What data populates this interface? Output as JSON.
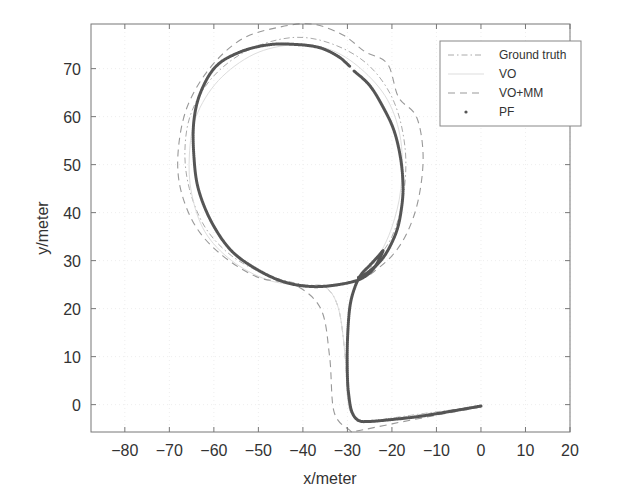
{
  "chart_data": {
    "type": "line",
    "title": "",
    "xlabel": "x/meter",
    "ylabel": "y/meter",
    "xlim": [
      -87.6,
      20
    ],
    "ylim": [
      -5.7,
      79.3
    ],
    "xticks": [
      -80,
      -70,
      -60,
      -50,
      -40,
      -30,
      -20,
      -10,
      0,
      10,
      20
    ],
    "yticks": [
      0,
      10,
      20,
      30,
      40,
      50,
      60,
      70
    ],
    "grid": true,
    "legend_position": "upper right",
    "series": [
      {
        "name": "Ground truth",
        "style": "dash-dot",
        "color": "#aaaaaa",
        "x": [
          0,
          -10,
          -20,
          -26,
          -29,
          -30,
          -30.5,
          -32,
          -35,
          -40,
          -48,
          -56,
          -62,
          -65.5,
          -66.5,
          -65,
          -60,
          -52,
          -42,
          -33,
          -25,
          -19.5,
          -17,
          -17.5,
          -20,
          -24,
          -26
        ],
        "y": [
          -0.4,
          -1.5,
          -2.8,
          -3.7,
          -2,
          2,
          10,
          20,
          24.5,
          25,
          27,
          31,
          37,
          45,
          53,
          61,
          68.5,
          74,
          76.5,
          75,
          70.5,
          63,
          53,
          43,
          35,
          29.5,
          27
        ]
      },
      {
        "name": "VO",
        "style": "solid-light",
        "color": "#dddddd",
        "x": [
          0,
          -10,
          -20,
          -26,
          -29,
          -30,
          -30.5,
          -32,
          -35,
          -40,
          -48,
          -56,
          -62,
          -65,
          -65.5,
          -64,
          -59,
          -51,
          -42,
          -34,
          -27,
          -21,
          -18,
          -18,
          -20,
          -23,
          -26
        ],
        "y": [
          -0.4,
          -1.6,
          -2.9,
          -3.6,
          -2,
          2,
          10,
          20,
          24.5,
          24.8,
          26,
          30,
          36,
          44,
          52,
          60,
          67.5,
          73,
          75,
          74,
          70,
          63.5,
          55,
          45,
          37,
          31,
          28
        ]
      },
      {
        "name": "VO+MM",
        "style": "dashed",
        "color": "#999999",
        "x": [
          0,
          -10,
          -20,
          -28,
          -29.5,
          -33,
          -34,
          -36,
          -42,
          -50,
          -58,
          -64,
          -67.5,
          -68,
          -66,
          -61,
          -54,
          -46,
          -38,
          -31,
          -26,
          -21,
          -18.5,
          -14.5,
          -13,
          -14,
          -16.5,
          -20,
          -25
        ],
        "y": [
          -0.5,
          -2.2,
          -4,
          -5.5,
          -5.3,
          -1.5,
          10,
          20,
          25,
          26.5,
          31,
          37,
          45,
          53,
          62,
          70,
          76,
          78.5,
          79.3,
          77,
          73.5,
          71,
          64,
          60,
          52,
          43,
          36,
          31,
          27
        ]
      },
      {
        "name": "PF",
        "style": "dots",
        "color": "#555555",
        "x": [
          0,
          -5,
          -10,
          -15,
          -20,
          -25,
          -27.5,
          -29,
          -29.7,
          -30,
          -30,
          -29.5,
          -28.5,
          -27,
          -25,
          -23,
          -22,
          -24,
          -27,
          -32,
          -38,
          -44,
          -50,
          -56,
          -60.5,
          -63.5,
          -64.5,
          -64.5,
          -63,
          -59.5,
          -54,
          -47.5,
          -41,
          -36,
          -32,
          -29.5
        ],
        "y": [
          -0.3,
          -1.1,
          -1.9,
          -2.6,
          -3.1,
          -3.5,
          -3.3,
          -1.5,
          2,
          6,
          13,
          20,
          24,
          27,
          29,
          31,
          32,
          28.5,
          26.2,
          25,
          24.6,
          25.5,
          28,
          32,
          38,
          45,
          52,
          59,
          65,
          70.5,
          73.5,
          75,
          75,
          74.3,
          72.5,
          70.5
        ]
      },
      {
        "name": "PF (segment 2)",
        "style": "dots",
        "color": "#555555",
        "x": [
          -28.5,
          -25,
          -22,
          -19.5,
          -18,
          -17.5,
          -18,
          -19,
          -21,
          -23,
          -25.5,
          -27.5
        ],
        "y": [
          69.5,
          66.5,
          62,
          57,
          51,
          45,
          40,
          36,
          32,
          29.5,
          27.5,
          26.5
        ]
      }
    ]
  },
  "legend": {
    "items": [
      {
        "label": "Ground truth",
        "style": "dash-dot"
      },
      {
        "label": "VO",
        "style": "solid-light"
      },
      {
        "label": "VO+MM",
        "style": "dashed"
      },
      {
        "label": "PF",
        "style": "dot"
      }
    ]
  }
}
